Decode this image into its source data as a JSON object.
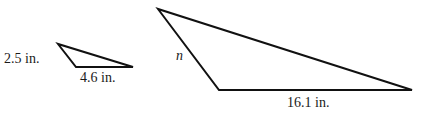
{
  "diagram": {
    "type": "similar-triangles",
    "stroke_color": "#111111",
    "small_triangle": {
      "side_left_label": "2.5 in.",
      "side_bottom_label": "4.6 in."
    },
    "large_triangle": {
      "side_left_label": "n",
      "side_bottom_label": "16.1 in."
    }
  }
}
